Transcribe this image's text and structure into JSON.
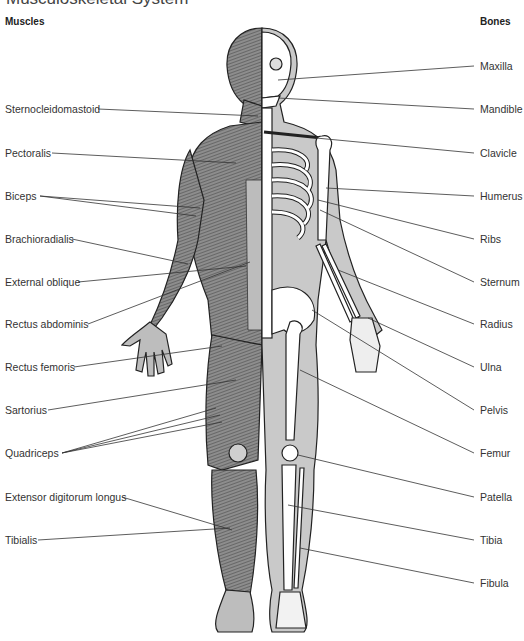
{
  "title": "Musculoskeletal System",
  "columns": {
    "left": "Muscles",
    "right": "Bones"
  },
  "muscles": [
    {
      "label": "Sternocleidomastoid",
      "y": 109
    },
    {
      "label": "Pectoralis",
      "y": 153
    },
    {
      "label": "Biceps",
      "y": 196
    },
    {
      "label": "Brachioradialis",
      "y": 239
    },
    {
      "label": "External oblique",
      "y": 282
    },
    {
      "label": "Rectus abdominis",
      "y": 324
    },
    {
      "label": "Rectus femoris",
      "y": 367
    },
    {
      "label": "Sartorius",
      "y": 410
    },
    {
      "label": "Quadriceps",
      "y": 453
    },
    {
      "label": "Extensor digitorum longus",
      "y": 497
    },
    {
      "label": "Tibialis",
      "y": 540
    }
  ],
  "bones": [
    {
      "label": "Maxilla",
      "y": 66
    },
    {
      "label": "Mandible",
      "y": 109
    },
    {
      "label": "Clavicle",
      "y": 153
    },
    {
      "label": "Humerus",
      "y": 196
    },
    {
      "label": "Ribs",
      "y": 239
    },
    {
      "label": "Sternum",
      "y": 282
    },
    {
      "label": "Radius",
      "y": 324
    },
    {
      "label": "Ulna",
      "y": 367
    },
    {
      "label": "Pelvis",
      "y": 410
    },
    {
      "label": "Femur",
      "y": 453
    },
    {
      "label": "Patella",
      "y": 497
    },
    {
      "label": "Tibia",
      "y": 540
    },
    {
      "label": "Fibula",
      "y": 583
    }
  ],
  "colors": {
    "muscle_fill": "#8a8a8a",
    "skin_fill": "#c9c9c9",
    "bone_fill": "#ffffff",
    "outline": "#222222",
    "leader": "#333333"
  }
}
